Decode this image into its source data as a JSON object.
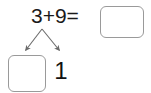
{
  "worksheet": {
    "type": "math-decomposition-problem",
    "equation": {
      "addend_1": "3",
      "operator_plus": "+",
      "addend_2": "9",
      "operator_equals": "=",
      "text": "3+9="
    },
    "sum_box": {
      "value": "",
      "placeholder": "",
      "label": "sum answer box"
    },
    "decomposition": {
      "tens_box": {
        "value": "",
        "placeholder": "",
        "label": "tens place answer box"
      },
      "ones_digit": "1"
    },
    "arrows": {
      "count": 2,
      "origin_label": "branch point below equation",
      "left_arrow_label": "arrow to tens box",
      "right_arrow_label": "arrow to ones digit"
    },
    "colors": {
      "background": "#ffffff",
      "text": "#1a1a1a",
      "box_border": "#9a9a9a",
      "arrow": "#6b6b6b"
    }
  }
}
